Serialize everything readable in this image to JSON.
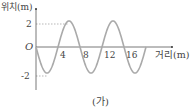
{
  "chart_data": {
    "type": "line",
    "title": "",
    "caption": "(가)",
    "xlabel": "거리(m)",
    "ylabel": "위치(m)",
    "x_ticks": [
      4,
      8,
      12,
      16
    ],
    "y_ticks": [
      2,
      -2
    ],
    "origin_label": "O",
    "xlim": [
      0,
      20
    ],
    "ylim": [
      -2,
      2
    ],
    "grid": false,
    "amplitude": 2,
    "wavelength": 8,
    "function": "y = -2 sin(pi x / 4)",
    "series": [
      {
        "name": "wave",
        "x": [
          0,
          2,
          4,
          6,
          8,
          10,
          12,
          14,
          16,
          18,
          20
        ],
        "y": [
          0,
          -2,
          0,
          2,
          0,
          -2,
          0,
          2,
          0,
          -2,
          0
        ]
      }
    ],
    "line_color": "#aaaaaa",
    "axis_color": "#555555"
  }
}
